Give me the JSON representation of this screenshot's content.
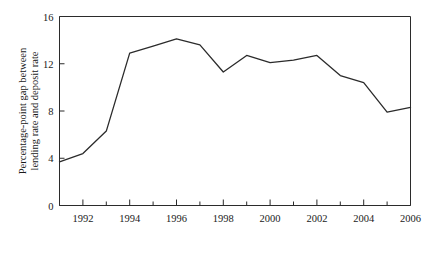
{
  "chart_data": {
    "type": "line",
    "title": "",
    "xlabel": "",
    "ylabel_lines": [
      "Percentage-point gap between",
      "lending rate and deposit rate"
    ],
    "ylabel": "Percentage-point gap between lending rate and deposit rate",
    "x": [
      1991,
      1992,
      1993,
      1994,
      1995,
      1996,
      1997,
      1998,
      1999,
      2000,
      2001,
      2002,
      2003,
      2004,
      2005,
      2006
    ],
    "values": [
      3.7,
      4.4,
      6.3,
      12.9,
      13.5,
      14.1,
      13.6,
      11.3,
      12.7,
      12.1,
      12.3,
      12.7,
      11.0,
      10.4,
      7.9,
      8.3
    ],
    "xlim": [
      1991,
      2006
    ],
    "ylim": [
      0,
      16
    ],
    "yticks": [
      0,
      4,
      8,
      12,
      16
    ],
    "ytick_labels": [
      "0",
      "4",
      "8",
      "12",
      "16"
    ],
    "xticks": [
      1992,
      1994,
      1996,
      1998,
      2000,
      2002,
      2004,
      2006
    ],
    "xtick_labels": [
      "1992",
      "1994",
      "1996",
      "1998",
      "2000",
      "2002",
      "2004",
      "2006"
    ],
    "xminor_ticks": [
      1991,
      1992,
      1993,
      1994,
      1995,
      1996,
      1997,
      1998,
      1999,
      2000,
      2001,
      2002,
      2003,
      2004,
      2005,
      2006
    ],
    "grid": false,
    "legend": null,
    "series_color": "#2b2b2b",
    "background_color": "#ffffff"
  }
}
